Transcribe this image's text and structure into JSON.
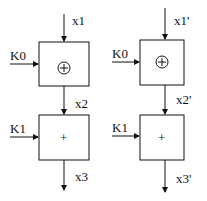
{
  "diagram": {
    "left": {
      "input_top": "x1",
      "key_top": "K0",
      "op_top": "⊕",
      "mid": "x2",
      "key_bottom": "K1",
      "op_bottom": "+",
      "output": "x3"
    },
    "right": {
      "input_top": "x1'",
      "key_top": "K0",
      "op_top": "⊕",
      "mid": "x2'",
      "key_bottom": "K1",
      "op_bottom": "+",
      "output": "x3'"
    }
  }
}
